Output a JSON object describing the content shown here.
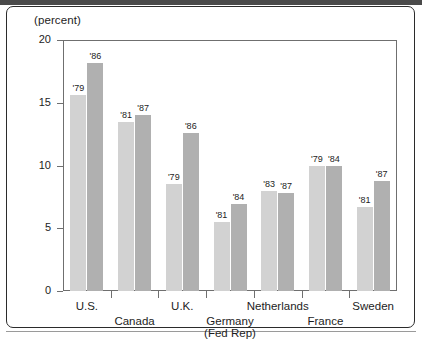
{
  "chart_data": {
    "type": "bar",
    "title": "",
    "subtitle": "",
    "ylabel": "(percent)",
    "xlabel": "",
    "ylim": [
      0,
      20
    ],
    "yticks": [
      0,
      5,
      10,
      15,
      20
    ],
    "ytick_labels": [
      "0",
      "5",
      "10",
      "15",
      "20"
    ],
    "grid": false,
    "legend": "none",
    "categories": [
      "U.S.",
      "Canada",
      "U.K.",
      "Germany\n(Fed Rep)",
      "Netherlands",
      "France",
      "Sweden"
    ],
    "category_labels": [
      {
        "line1": "U.S.",
        "line2": "",
        "row": "top"
      },
      {
        "line1": "Canada",
        "line2": "",
        "row": "bottom"
      },
      {
        "line1": "U.K.",
        "line2": "",
        "row": "top"
      },
      {
        "line1": "Germany",
        "line2": "(Fed Rep)",
        "row": "bottom"
      },
      {
        "line1": "Netherlands",
        "line2": "",
        "row": "top"
      },
      {
        "line1": "France",
        "line2": "",
        "row": "bottom"
      },
      {
        "line1": "Sweden",
        "line2": "",
        "row": "top"
      }
    ],
    "series": [
      {
        "name": "earlier year",
        "color": "#d2d2d2",
        "values": [
          15.6,
          13.5,
          8.5,
          5.5,
          8.0,
          10.0,
          6.7
        ],
        "point_labels": [
          "'79",
          "'81",
          "'79",
          "'81",
          "'83",
          "'79",
          "'81"
        ]
      },
      {
        "name": "later year",
        "color": "#b0b0b0",
        "values": [
          18.2,
          14.0,
          12.6,
          6.9,
          7.8,
          10.0,
          8.8
        ],
        "point_labels": [
          "'86",
          "'87",
          "'86",
          "'84",
          "'87",
          "'84",
          "'87"
        ]
      }
    ]
  },
  "colors": {
    "series_light": "#d2d2d2",
    "series_dark": "#b0b0b0",
    "axis": "#6f6f6f",
    "text": "#1d1d1d",
    "border": "#2b2b2b"
  }
}
